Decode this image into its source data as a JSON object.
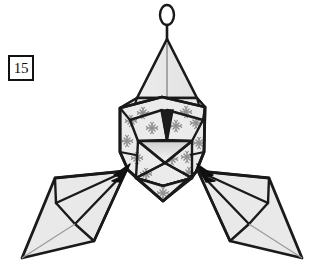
{
  "figure": {
    "step_number": "15",
    "colors": {
      "paper_fill": "#e9e9e9",
      "paper_fill_light": "#f1f1f1",
      "paper_fill_dark": "#d6d6d6",
      "outline": "#1a1a1a",
      "crease_line": "#1a1a1a",
      "soft_crease": "#9a9a9a",
      "snowflake": "#8f8f8f",
      "background": "#ffffff",
      "arrow": "#111111"
    },
    "parts": [
      {
        "name": "hanging-loop",
        "label": "hanging ring"
      },
      {
        "name": "top-spire",
        "label": "upper triangular spire"
      },
      {
        "name": "central-body",
        "label": "central snowflake body"
      },
      {
        "name": "bottom-point",
        "label": "lower point"
      },
      {
        "name": "left-flap",
        "label": "left kite flap"
      },
      {
        "name": "right-flap",
        "label": "right kite flap"
      },
      {
        "name": "left-fold-arrow",
        "label": "fold arrow pointing right-up into body"
      },
      {
        "name": "right-fold-arrow",
        "label": "fold arrow pointing left-up into body"
      }
    ],
    "snowflake_count": 14
  }
}
